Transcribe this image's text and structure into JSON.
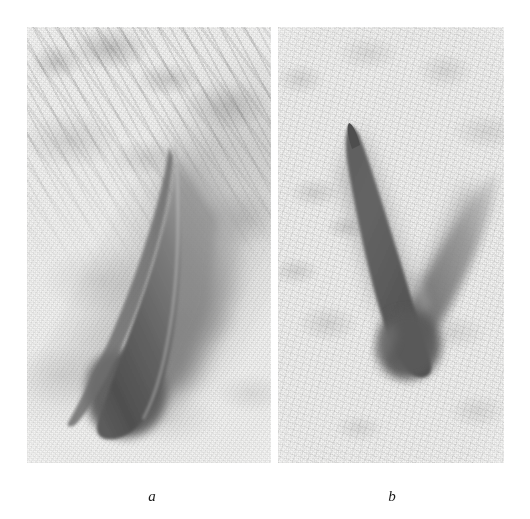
{
  "figure": {
    "kind": "two-panel grayscale photographic plate",
    "background_color": "#ffffff",
    "panels": [
      {
        "id": "a",
        "caption": "a",
        "subject": "slender dark wedge / spike with diffuse shadow on mottled light background",
        "base_tone": "#f3f3f2",
        "shadow_color": "#8a8a8a",
        "object_color": "#5a5a5a",
        "texture": "diagonal streaked granular field, darker toward upper-left",
        "object_tip": "upper-right",
        "object_base": "lower-left"
      },
      {
        "id": "b",
        "caption": "b",
        "subject": "V-shaped dark spike pair, sharp left arm and diffuse right arm, on mottled light background",
        "base_tone": "#f5f5f4",
        "shadow_color": "#8f8f8f",
        "object_color": "#555555",
        "texture": "fine mottled granular field, fairly uniform",
        "object_tip": "upper-left",
        "object_vertex": "lower-center"
      }
    ]
  },
  "captions": {
    "panel_a_label": "a",
    "panel_b_label": "b"
  },
  "colors": {
    "page": "#ffffff",
    "ink": "#1a1a1a",
    "film_light": "#f3f3f2",
    "film_mid": "#b8b8b8",
    "film_dark": "#4f4f4f"
  }
}
